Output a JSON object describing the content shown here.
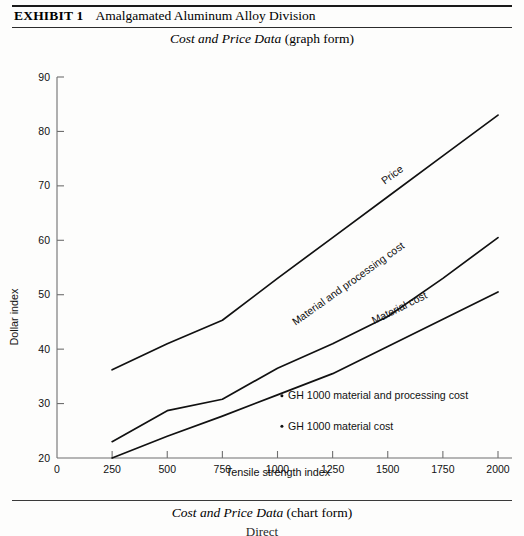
{
  "exhibit": {
    "tag": "EXHIBIT 1",
    "title": "Amalgamated Aluminum Alloy Division",
    "subtitle_italic": "Cost and Price Data",
    "subtitle_rest": "(graph form)"
  },
  "footer": {
    "caption_italic": "Cost and Price Data",
    "caption_rest": "(chart form)",
    "cut_text": "Direct"
  },
  "annotations": [
    {
      "marker": "•",
      "text": "GH 1000 material and processing cost"
    },
    {
      "marker": "•",
      "text": "GH 1000 material cost"
    }
  ],
  "chart_data": {
    "type": "line",
    "title": "Cost and Price Data (graph form)",
    "xlabel": "Tensile strength index",
    "ylabel": "Dollar index",
    "xlim": [
      0,
      2000
    ],
    "ylim": [
      20,
      90
    ],
    "xticks": [
      0,
      250,
      500,
      750,
      1000,
      1250,
      1500,
      1750,
      2000
    ],
    "yticks": [
      20,
      30,
      40,
      50,
      60,
      70,
      80,
      90
    ],
    "grid": false,
    "legend": "inline-curve-labels",
    "x": [
      250,
      500,
      750,
      1000,
      1250,
      1500,
      1750,
      2000
    ],
    "series": [
      {
        "name": "Price",
        "label": "Price",
        "values": [
          36.2,
          41.0,
          45.3,
          53.0,
          60.5,
          68.0,
          75.5,
          83.0
        ],
        "label_x": 1530,
        "label_y": 71.5
      },
      {
        "name": "Material and processing cost",
        "label": "Material and processing cost",
        "values": [
          23.0,
          28.7,
          30.8,
          36.5,
          41.0,
          46.0,
          53.0,
          60.5
        ],
        "label_x": 1330,
        "label_y": 51.5
      },
      {
        "name": "Material cost",
        "label": "Material cost",
        "values": [
          20.0,
          24.0,
          27.7,
          31.6,
          35.5,
          40.5,
          45.5,
          50.5
        ],
        "label_x": 1560,
        "label_y": 47.0
      }
    ],
    "annotation_points": [
      {
        "text": "GH 1000 material and processing cost",
        "x": 1020,
        "y": 30.8
      },
      {
        "text": "GH 1000 material cost",
        "x": 1020,
        "y": 25.2
      }
    ]
  }
}
